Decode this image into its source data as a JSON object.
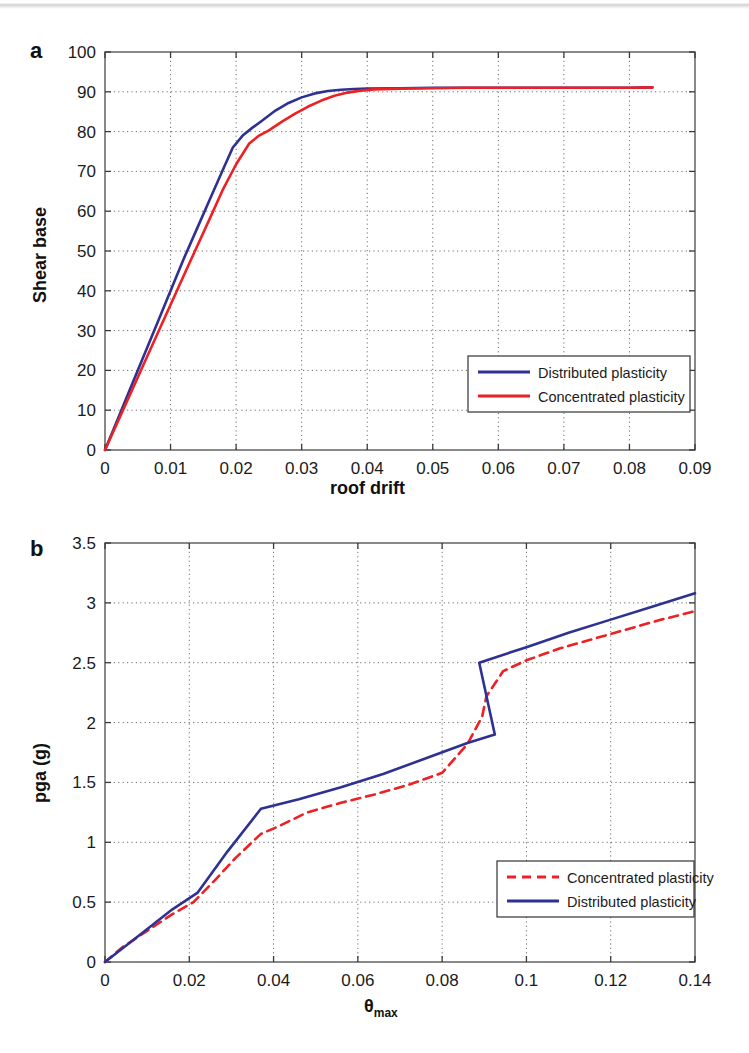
{
  "figure": {
    "panel_a_label": "a",
    "panel_b_label": "b"
  },
  "chart_data": [
    {
      "id": "panel-a",
      "type": "line",
      "panel": "a",
      "title": "",
      "xlabel": "roof drift",
      "ylabel": "Shear base",
      "xlim": [
        0,
        0.09
      ],
      "ylim": [
        0,
        100
      ],
      "xticks": [
        "0",
        "0.01",
        "0.02",
        "0.03",
        "0.04",
        "0.05",
        "0.06",
        "0.07",
        "0.08",
        "0.09"
      ],
      "xtick_values": [
        0,
        0.01,
        0.02,
        0.03,
        0.04,
        0.05,
        0.06,
        0.07,
        0.08,
        0.09
      ],
      "yticks": [
        "0",
        "10",
        "20",
        "30",
        "40",
        "50",
        "60",
        "70",
        "80",
        "90",
        "100"
      ],
      "ytick_values": [
        0,
        10,
        20,
        30,
        40,
        50,
        60,
        70,
        80,
        90,
        100
      ],
      "grid": true,
      "legend_position": "lower right",
      "series": [
        {
          "name": "Distributed plasticity",
          "color": "#2e3192",
          "style": "solid",
          "x": [
            0,
            0.002,
            0.004,
            0.006,
            0.008,
            0.01,
            0.012,
            0.014,
            0.016,
            0.018,
            0.0195,
            0.021,
            0.0225,
            0.024,
            0.026,
            0.028,
            0.03,
            0.032,
            0.034,
            0.036,
            0.038,
            0.04,
            0.045,
            0.05,
            0.055,
            0.06,
            0.065,
            0.07,
            0.075,
            0.08,
            0.0835
          ],
          "y": [
            0,
            8.0,
            16.0,
            24.0,
            32.0,
            40.0,
            48.0,
            55.5,
            63.0,
            70.5,
            76.0,
            79.0,
            81.0,
            82.8,
            85.3,
            87.2,
            88.6,
            89.6,
            90.2,
            90.5,
            90.7,
            90.8,
            90.9,
            91.0,
            91.0,
            91.0,
            91.0,
            91.0,
            91.0,
            91.0,
            91.1
          ]
        },
        {
          "name": "Concentrated plasticity",
          "color": "#ed2024",
          "style": "solid",
          "x": [
            0,
            0.002,
            0.004,
            0.006,
            0.008,
            0.01,
            0.012,
            0.014,
            0.016,
            0.018,
            0.02,
            0.022,
            0.0235,
            0.025,
            0.027,
            0.029,
            0.031,
            0.033,
            0.035,
            0.037,
            0.039,
            0.041,
            0.045,
            0.05,
            0.055,
            0.06,
            0.065,
            0.07,
            0.075,
            0.08,
            0.0835
          ],
          "y": [
            0,
            7.3,
            14.6,
            21.9,
            29.2,
            36.5,
            43.8,
            51.0,
            58.2,
            65.5,
            71.8,
            77.0,
            79.0,
            80.3,
            82.5,
            84.5,
            86.3,
            87.8,
            89.0,
            89.8,
            90.3,
            90.6,
            90.8,
            90.9,
            91.0,
            91.0,
            91.0,
            91.0,
            91.0,
            91.0,
            91.1
          ]
        }
      ]
    },
    {
      "id": "panel-b",
      "type": "line",
      "panel": "b",
      "title": "",
      "xlabel": "θmax",
      "xlabel_base": "θ",
      "xlabel_sub": "max",
      "ylabel": "pga (g)",
      "xlim": [
        0,
        0.14
      ],
      "ylim": [
        0,
        3.5
      ],
      "xticks": [
        "0",
        "0.02",
        "0.04",
        "0.06",
        "0.08",
        "0.1",
        "0.12",
        "0.14"
      ],
      "xtick_values": [
        0,
        0.02,
        0.04,
        0.06,
        0.08,
        0.1,
        0.12,
        0.14
      ],
      "yticks": [
        "0",
        "0.5",
        "1",
        "1.5",
        "2",
        "2.5",
        "3",
        "3.5"
      ],
      "ytick_values": [
        0,
        0.5,
        1,
        1.5,
        2,
        2.5,
        3,
        3.5
      ],
      "grid": true,
      "legend_position": "lower right",
      "series": [
        {
          "name": "Concentrated plasticity",
          "color": "#ed2024",
          "style": "dashed",
          "x": [
            0,
            0.004,
            0.01,
            0.016,
            0.021,
            0.026,
            0.031,
            0.037,
            0.041,
            0.048,
            0.056,
            0.064,
            0.072,
            0.08,
            0.086,
            0.0895,
            0.0905,
            0.0945,
            0.1,
            0.108,
            0.116,
            0.124,
            0.132,
            0.14
          ],
          "y": [
            0,
            0.12,
            0.26,
            0.4,
            0.5,
            0.68,
            0.87,
            1.07,
            1.13,
            1.25,
            1.33,
            1.4,
            1.48,
            1.58,
            1.82,
            2.05,
            2.22,
            2.43,
            2.52,
            2.62,
            2.7,
            2.78,
            2.86,
            2.93
          ]
        },
        {
          "name": "Distributed plasticity",
          "color": "#2e3192",
          "style": "solid",
          "x": [
            0,
            0.008,
            0.016,
            0.022,
            0.029,
            0.037,
            0.046,
            0.056,
            0.066,
            0.076,
            0.086,
            0.0925,
            0.0925,
            0.0888,
            0.1,
            0.11,
            0.12,
            0.13,
            0.14
          ],
          "y": [
            0,
            0.22,
            0.44,
            0.58,
            0.92,
            1.28,
            1.36,
            1.46,
            1.57,
            1.7,
            1.83,
            1.9,
            1.9,
            2.5,
            2.63,
            2.75,
            2.86,
            2.97,
            3.08
          ]
        }
      ]
    }
  ]
}
